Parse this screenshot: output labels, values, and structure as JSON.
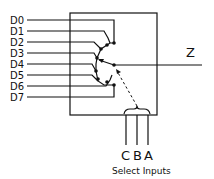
{
  "diagram": {
    "type": "8-to-1 multiplexer",
    "inputs": [
      "D0",
      "D1",
      "D2",
      "D3",
      "D4",
      "D5",
      "D6",
      "D7"
    ],
    "output": "Z",
    "select_lines": [
      "C",
      "B",
      "A"
    ],
    "select_caption": "Select Inputs",
    "colors": {
      "line": "#111111",
      "background": "#ffffff"
    }
  }
}
